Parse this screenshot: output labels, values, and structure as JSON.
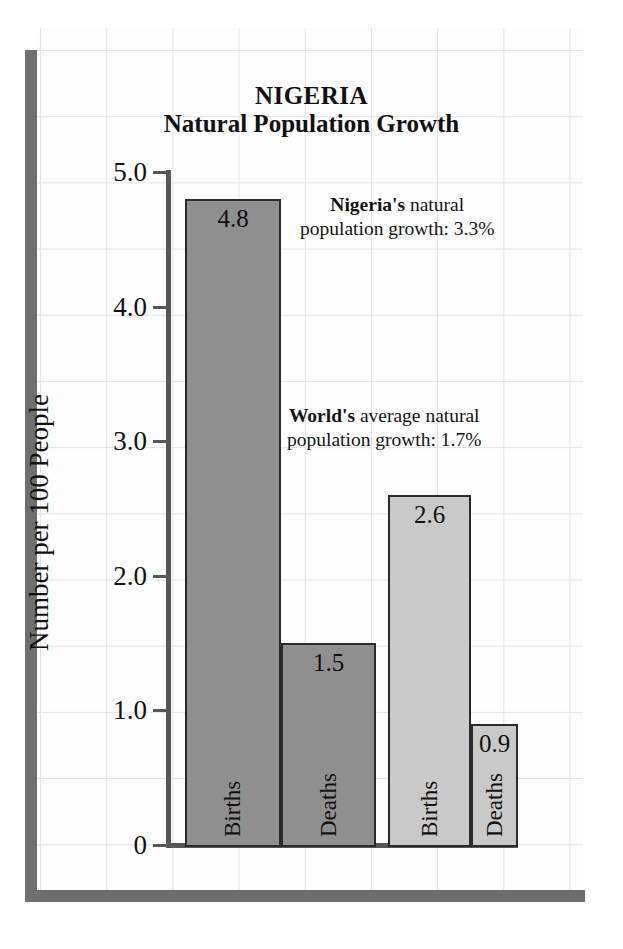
{
  "chart_data": {
    "type": "bar",
    "title": "NIGERIA",
    "subtitle": "Natural Population Growth",
    "ylabel": "Number per 100 People",
    "xlabel": "",
    "ylim": [
      0,
      5.0
    ],
    "ytick_labels": [
      "5.0",
      "4.0",
      "3.0",
      "2.0",
      "1.0",
      "0"
    ],
    "ytick_values": [
      5.0,
      4.0,
      3.0,
      2.0,
      1.0,
      0
    ],
    "grid": true,
    "legend": "none",
    "groups": [
      {
        "name": "Nigeria",
        "color": "#8f8f8f",
        "bars": [
          {
            "category": "Births",
            "value": 4.8,
            "label": "4.8"
          },
          {
            "category": "Deaths",
            "value": 1.5,
            "label": "1.5"
          }
        ]
      },
      {
        "name": "World",
        "color": "#c9c9c9",
        "bars": [
          {
            "category": "Births",
            "value": 2.6,
            "label": "2.6"
          },
          {
            "category": "Deaths",
            "value": 0.9,
            "label": "0.9"
          }
        ]
      }
    ],
    "categories": [
      "Births",
      "Deaths",
      "Births",
      "Deaths"
    ],
    "values": [
      4.8,
      1.5,
      2.6,
      0.9
    ],
    "annotations": [
      {
        "id": "nigeria",
        "bold_lead": "Nigeria's",
        "line1_rest": " natural",
        "line2": "population growth:  3.3%",
        "value": "3.3%"
      },
      {
        "id": "world",
        "bold_lead": "World's",
        "line1_rest": " average natural",
        "line2": "population growth:  1.7%",
        "value": "1.7%"
      }
    ]
  },
  "colors": {
    "bar_dark": "#8f8f8f",
    "bar_light": "#c9c9c9",
    "bar_border": "#2b2b2b",
    "axis": "#575757",
    "frame": "#6f6f6f",
    "grid": "#e3e3e6",
    "text": "#111111"
  }
}
